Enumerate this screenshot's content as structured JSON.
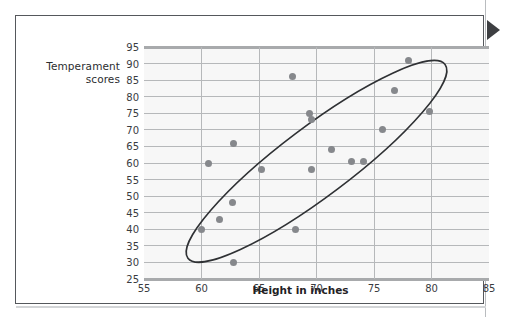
{
  "figure": {
    "frame_border_color": "#55585c",
    "plot_background": "#f7f7f7",
    "gridline_color": "#b6b8ba",
    "point_color": "#86888c",
    "ellipse_color": "#2f3134",
    "marker_color": "#3d3f42",
    "edge_marker_name": "right-triangle-marker"
  },
  "labels": {
    "y_axis_title_line1": "Temperament",
    "y_axis_title_line2": "scores",
    "x_axis_title": "Height in inches"
  },
  "chart_data": {
    "type": "scatter",
    "title": "",
    "xlabel": "Height in inches",
    "ylabel": "Temperament scores",
    "xlim": [
      55,
      85
    ],
    "ylim": [
      25,
      95
    ],
    "xticks": [
      55,
      60,
      65,
      70,
      75,
      80,
      85
    ],
    "yticks": [
      25,
      30,
      35,
      40,
      45,
      50,
      55,
      60,
      65,
      70,
      75,
      80,
      85,
      90,
      95
    ],
    "grid": true,
    "legend": "none",
    "annotations": [
      {
        "type": "ellipse",
        "label": "correlation-ellipse",
        "center_x": 70.0,
        "center_y": 60.5,
        "width": 28.0,
        "height": 21.0,
        "rotation_deg": -37
      }
    ],
    "points": [
      {
        "x": 60.0,
        "y": 40.0
      },
      {
        "x": 60.6,
        "y": 60.0
      },
      {
        "x": 61.6,
        "y": 43.0
      },
      {
        "x": 62.8,
        "y": 30.0
      },
      {
        "x": 62.7,
        "y": 48.0
      },
      {
        "x": 62.8,
        "y": 66.0
      },
      {
        "x": 65.2,
        "y": 58.0
      },
      {
        "x": 67.9,
        "y": 86.0
      },
      {
        "x": 68.2,
        "y": 40.0
      },
      {
        "x": 69.4,
        "y": 75.0
      },
      {
        "x": 69.6,
        "y": 73.0
      },
      {
        "x": 69.6,
        "y": 58.0
      },
      {
        "x": 71.3,
        "y": 64.0
      },
      {
        "x": 73.0,
        "y": 60.5
      },
      {
        "x": 74.1,
        "y": 60.5
      },
      {
        "x": 75.7,
        "y": 70.0
      },
      {
        "x": 76.8,
        "y": 82.0
      },
      {
        "x": 78.0,
        "y": 91.0
      },
      {
        "x": 79.8,
        "y": 75.5
      }
    ]
  }
}
